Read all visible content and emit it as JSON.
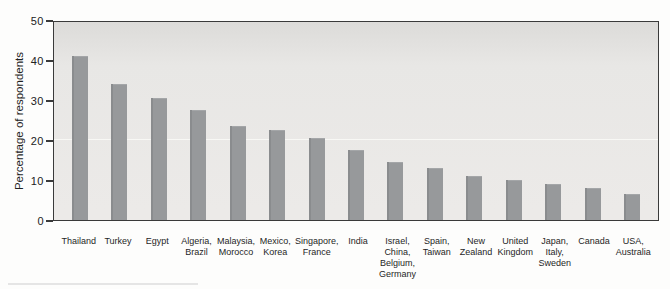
{
  "figure": {
    "background_color": "#fdfdfc",
    "plot_background_color": "#e8e7e5",
    "bar_color": "#97999b",
    "axis_color": "#3a3a3a",
    "text_color": "#1f1f1f"
  },
  "chart_data": {
    "type": "bar",
    "title": "",
    "xlabel": "",
    "ylabel": "Percentage of respondents",
    "ylim": [
      0,
      50
    ],
    "yticks": [
      0,
      10,
      20,
      30,
      40,
      50
    ],
    "grid": "single faint horizontal gridline at y=20",
    "legend": "none",
    "categories": [
      "Thailand",
      "Turkey",
      "Egypt",
      "Algeria,\nBrazil",
      "Malaysia,\nMorocco",
      "Mexico,\nKorea",
      "Singapore,\nFrance",
      "India",
      "Israel,\nChina,\nBelgium,\nGermany",
      "Spain,\nTaiwan",
      "New\nZealand",
      "United\nKingdom",
      "Japan,\nItaly,\nSweden",
      "Canada",
      "USA,\nAustralia"
    ],
    "values": [
      41,
      34,
      30.5,
      27.5,
      23.5,
      22.5,
      20.5,
      17.5,
      14.5,
      13,
      11,
      10,
      9,
      8,
      6.5
    ],
    "gridline_value": 20,
    "units_per_px": 0.25
  }
}
